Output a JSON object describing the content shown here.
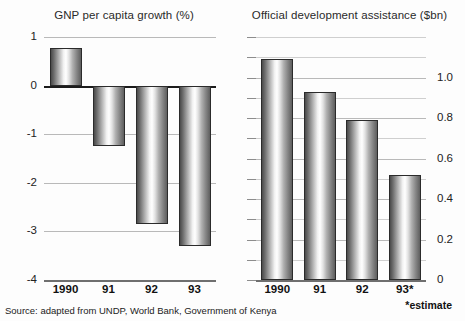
{
  "figure": {
    "source_note": "Source: adapted from UNDP, World Bank, Government of Kenya",
    "estimate_note": "*estimate"
  },
  "chart_data": [
    {
      "type": "bar",
      "panel": "left",
      "title": "GNP per capita growth (%)",
      "xlabel": "",
      "ylabel": "",
      "categories": [
        "1990",
        "91",
        "92",
        "93"
      ],
      "values": [
        0.78,
        -1.25,
        -2.85,
        -3.3
      ],
      "ylim": [
        -4,
        1
      ],
      "yticks": [
        1,
        0,
        -1,
        -2,
        -3,
        -4
      ],
      "ytick_labels": [
        "1",
        "0",
        "-1",
        "-2",
        "-3",
        "-4"
      ],
      "grid": true,
      "legend": "none"
    },
    {
      "type": "bar",
      "panel": "right",
      "title": "Official development assistance ($bn)",
      "xlabel": "",
      "ylabel": "",
      "categories": [
        "1990",
        "91",
        "92",
        "93*"
      ],
      "values": [
        1.09,
        0.93,
        0.79,
        0.52
      ],
      "ylim": [
        0,
        1.2
      ],
      "yticks": [
        1.2,
        1.1,
        1.0,
        0.9,
        0.8,
        0.7,
        0.6,
        0.5,
        0.4,
        0.3,
        0.2,
        0.1,
        0
      ],
      "ytick_labels": [
        "",
        "",
        "1.0",
        "",
        "0.8",
        "",
        "0.6",
        "",
        "0.4",
        "",
        "0.2",
        "",
        "0"
      ],
      "grid": true,
      "legend": "none"
    }
  ]
}
